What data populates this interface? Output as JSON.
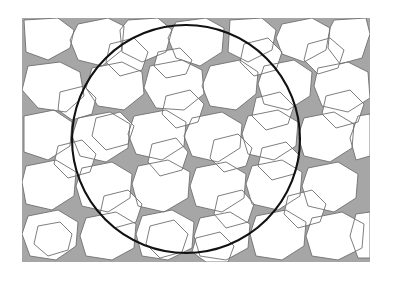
{
  "figure": {
    "kind": "micrograph-schematic",
    "canvas": {
      "width": 393,
      "height": 285,
      "background": "#ffffff"
    },
    "content_bounds": {
      "x": 22,
      "y": 18,
      "width": 348,
      "height": 244
    }
  },
  "colors": {
    "background": "#ffffff",
    "grain": "#ffffff",
    "matrix": "#a6a6a6",
    "grain_boundary": "#6f6f6f",
    "circle": "#111111"
  },
  "sampling_circle": {
    "label": "sampling-circle",
    "center_x": 186,
    "center_y": 139,
    "radius": 114,
    "stroke_width": 2.1
  },
  "legend": {
    "grain_label": "grain (light phase)",
    "matrix_label": "second phase (gray)",
    "circle_label": "field of view"
  },
  "chart_data": {
    "type": "scatter",
    "xlabel": "",
    "ylabel": "",
    "grid": false,
    "legend_position": "none",
    "xlim": [
      22,
      370
    ],
    "ylim": [
      18,
      262
    ],
    "grain_count": 58,
    "matrix_area_fraction": 0.28,
    "grain_area_fraction": 0.72,
    "grains": [
      {
        "id": 1,
        "cx": 48,
        "cy": 58,
        "r": 20
      },
      {
        "id": 2,
        "cx": 92,
        "cy": 48,
        "r": 22
      },
      {
        "id": 3,
        "cx": 140,
        "cy": 42,
        "r": 21
      },
      {
        "id": 4,
        "cx": 186,
        "cy": 45,
        "r": 23
      },
      {
        "id": 5,
        "cx": 232,
        "cy": 42,
        "r": 20
      },
      {
        "id": 6,
        "cx": 276,
        "cy": 50,
        "r": 22
      },
      {
        "id": 7,
        "cx": 322,
        "cy": 44,
        "r": 21
      },
      {
        "id": 8,
        "cx": 356,
        "cy": 62,
        "r": 18
      },
      {
        "id": 9,
        "cx": 40,
        "cy": 104,
        "r": 19
      },
      {
        "id": 10,
        "cx": 84,
        "cy": 96,
        "r": 21
      },
      {
        "id": 11,
        "cx": 130,
        "cy": 92,
        "r": 22
      },
      {
        "id": 12,
        "cx": 178,
        "cy": 90,
        "r": 23
      },
      {
        "id": 13,
        "cx": 226,
        "cy": 94,
        "r": 21
      },
      {
        "id": 14,
        "cx": 272,
        "cy": 92,
        "r": 20
      },
      {
        "id": 15,
        "cx": 316,
        "cy": 98,
        "r": 22
      },
      {
        "id": 16,
        "cx": 354,
        "cy": 108,
        "r": 19
      },
      {
        "id": 17,
        "cx": 44,
        "cy": 150,
        "r": 20
      },
      {
        "id": 18,
        "cx": 90,
        "cy": 146,
        "r": 21
      },
      {
        "id": 19,
        "cx": 136,
        "cy": 142,
        "r": 20
      },
      {
        "id": 20,
        "cx": 182,
        "cy": 140,
        "r": 23
      },
      {
        "id": 21,
        "cx": 228,
        "cy": 144,
        "r": 21
      },
      {
        "id": 22,
        "cx": 274,
        "cy": 142,
        "r": 22
      },
      {
        "id": 23,
        "cx": 320,
        "cy": 148,
        "r": 20
      },
      {
        "id": 24,
        "cx": 356,
        "cy": 156,
        "r": 18
      },
      {
        "id": 25,
        "cx": 42,
        "cy": 196,
        "r": 21
      },
      {
        "id": 26,
        "cx": 88,
        "cy": 192,
        "r": 20
      },
      {
        "id": 27,
        "cx": 134,
        "cy": 190,
        "r": 22
      },
      {
        "id": 28,
        "cx": 180,
        "cy": 194,
        "r": 21
      },
      {
        "id": 29,
        "cx": 226,
        "cy": 190,
        "r": 20
      },
      {
        "id": 30,
        "cx": 272,
        "cy": 194,
        "r": 22
      },
      {
        "id": 31,
        "cx": 318,
        "cy": 192,
        "r": 21
      },
      {
        "id": 32,
        "cx": 356,
        "cy": 200,
        "r": 18
      },
      {
        "id": 33,
        "cx": 48,
        "cy": 238,
        "r": 20
      },
      {
        "id": 34,
        "cx": 96,
        "cy": 240,
        "r": 21
      },
      {
        "id": 35,
        "cx": 144,
        "cy": 238,
        "r": 20
      },
      {
        "id": 36,
        "cx": 192,
        "cy": 242,
        "r": 22
      },
      {
        "id": 37,
        "cx": 240,
        "cy": 238,
        "r": 20
      },
      {
        "id": 38,
        "cx": 288,
        "cy": 240,
        "r": 21
      },
      {
        "id": 39,
        "cx": 334,
        "cy": 238,
        "r": 20
      }
    ]
  }
}
